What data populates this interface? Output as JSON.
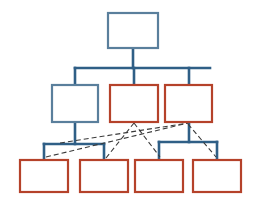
{
  "diagram": {
    "type": "org-chart",
    "background_color": "#ffffff",
    "canvas": {
      "width": 254,
      "height": 213
    },
    "palette": {
      "blue_node_stroke": "#5a7f9c",
      "red_node_stroke": "#b5422a",
      "node_fill": "#ffffff",
      "solid_connector": "#2f5f86",
      "dashed_connector": "#3a3a3a"
    },
    "style": {
      "node_stroke_width": 2.2,
      "solid_connector_width": 2.6,
      "dashed_connector_width": 1.1,
      "dash_pattern": "5,3"
    },
    "levels": [
      {
        "index": 0,
        "label": "Level 1",
        "node_count": 1
      },
      {
        "index": 1,
        "label": "Level 2",
        "node_count": 3
      },
      {
        "index": 2,
        "label": "Level 3",
        "node_count": 4
      }
    ],
    "nodes": [
      {
        "id": "n0",
        "label": "",
        "level": 0,
        "color": "blue",
        "x": 108,
        "y": 13,
        "w": 50,
        "h": 35
      },
      {
        "id": "n1a",
        "label": "",
        "level": 1,
        "color": "blue",
        "x": 52,
        "y": 85,
        "w": 46,
        "h": 37
      },
      {
        "id": "n1b",
        "label": "",
        "level": 1,
        "color": "red",
        "x": 110,
        "y": 85,
        "w": 48,
        "h": 37
      },
      {
        "id": "n1c",
        "label": "",
        "level": 1,
        "color": "red",
        "x": 165,
        "y": 85,
        "w": 47,
        "h": 37
      },
      {
        "id": "n2a",
        "label": "",
        "level": 2,
        "color": "red",
        "x": 20,
        "y": 160,
        "w": 48,
        "h": 32
      },
      {
        "id": "n2b",
        "label": "",
        "level": 2,
        "color": "red",
        "x": 80,
        "y": 160,
        "w": 48,
        "h": 32
      },
      {
        "id": "n2c",
        "label": "",
        "level": 2,
        "color": "red",
        "x": 135,
        "y": 160,
        "w": 48,
        "h": 32
      },
      {
        "id": "n2d",
        "label": "",
        "level": 2,
        "color": "red",
        "x": 193,
        "y": 160,
        "w": 48,
        "h": 32
      }
    ],
    "solid_connectors": [
      {
        "id": "c-root-drop",
        "from": "n0",
        "to": "bus-1",
        "points": "133,48 133,68"
      },
      {
        "id": "c-bus-1",
        "from": "bus-1",
        "to": "bus-1",
        "points": "75,68 210,68"
      },
      {
        "id": "c-bus-to-n1a",
        "from": "bus-1",
        "to": "n1a",
        "points": "75,68 75,85"
      },
      {
        "id": "c-bus-to-n1b",
        "from": "bus-1",
        "to": "n1b",
        "points": "134,68 134,85"
      },
      {
        "id": "c-bus-to-n1c",
        "from": "bus-1",
        "to": "n1c",
        "points": "189,68 189,85"
      },
      {
        "id": "c-n1a-drop",
        "from": "n1a",
        "to": "bus-2a",
        "points": "75,122 75,144"
      },
      {
        "id": "c-bus-2a",
        "from": "bus-2a",
        "to": "bus-2a",
        "points": "44,144 104,144"
      },
      {
        "id": "c-bus2a-n2a",
        "from": "bus-2a",
        "to": "n2a",
        "points": "44,144 44,160"
      },
      {
        "id": "c-bus2a-n2b",
        "from": "bus-2a",
        "to": "n2b",
        "points": "104,144 104,160"
      },
      {
        "id": "c-n1c-drop",
        "from": "n1c",
        "to": "bus-2b",
        "points": "189,122 189,142"
      },
      {
        "id": "c-bus-2b",
        "from": "bus-2b",
        "to": "bus-2b",
        "points": "159,142 217,142"
      },
      {
        "id": "c-bus2b-n2c",
        "from": "bus-2b",
        "to": "n2c",
        "points": "159,142 159,160"
      },
      {
        "id": "c-bus2b-n2d",
        "from": "bus-2b",
        "to": "n2d",
        "points": "217,142 217,160"
      }
    ],
    "dashed_connectors": [
      {
        "id": "d1",
        "from": "n2a",
        "to": "n1c",
        "points": "46,157 188,123"
      },
      {
        "id": "d2",
        "from": "n2b",
        "to": "n1b",
        "points": "106,158 134,123"
      },
      {
        "id": "d3",
        "from": "n1b",
        "to": "n2c",
        "points": "134,123 160,157"
      },
      {
        "id": "d4",
        "from": "n1c",
        "to": "n2d",
        "points": "188,124 216,157"
      },
      {
        "id": "d5",
        "from": "n1a",
        "to": "n1c",
        "points": "60,143 188,123"
      }
    ]
  }
}
